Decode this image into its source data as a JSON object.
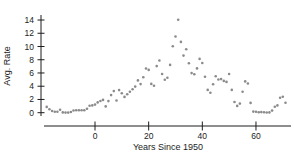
{
  "chart_data": {
    "type": "scatter",
    "title": "",
    "xlabel": "Years Since 1950",
    "ylabel": "Avg. Rate",
    "x_ticks": [
      0,
      20,
      40,
      60
    ],
    "y_ticks": [
      0,
      2,
      4,
      6,
      8,
      10,
      12,
      14
    ],
    "xlim": [
      -20,
      73
    ],
    "ylim": [
      0,
      14
    ],
    "grid": false,
    "legend": "none",
    "point_color": "#8b8b8b",
    "axis_color": "#1c1c1c",
    "points": [
      [
        -18,
        0.88
      ],
      [
        -17,
        0.52
      ],
      [
        -16,
        0.26
      ],
      [
        -15,
        0.14
      ],
      [
        -14,
        0.14
      ],
      [
        -13,
        0.45
      ],
      [
        -12,
        0.05
      ],
      [
        -11,
        0.02
      ],
      [
        -10,
        0.01
      ],
      [
        -9,
        0.1
      ],
      [
        -8,
        0.33
      ],
      [
        -7,
        0.37
      ],
      [
        -6,
        0.38
      ],
      [
        -5,
        0.38
      ],
      [
        -4,
        0.38
      ],
      [
        -3,
        0.6
      ],
      [
        -2,
        1.05
      ],
      [
        -1,
        1.1
      ],
      [
        0,
        1.22
      ],
      [
        1,
        1.55
      ],
      [
        2,
        1.77
      ],
      [
        3,
        1.94
      ],
      [
        4,
        0.95
      ],
      [
        5,
        1.75
      ],
      [
        6,
        2.66
      ],
      [
        7,
        3.27
      ],
      [
        8,
        1.84
      ],
      [
        9,
        3.41
      ],
      [
        10,
        2.93
      ],
      [
        11,
        2.38
      ],
      [
        12,
        2.78
      ],
      [
        13,
        3.16
      ],
      [
        14,
        3.55
      ],
      [
        15,
        3.95
      ],
      [
        16,
        4.88
      ],
      [
        17,
        4.32
      ],
      [
        18,
        5.34
      ],
      [
        19,
        6.68
      ],
      [
        20,
        6.46
      ],
      [
        21,
        4.35
      ],
      [
        22,
        4.07
      ],
      [
        23,
        7.04
      ],
      [
        24,
        7.89
      ],
      [
        25,
        5.84
      ],
      [
        26,
        4.99
      ],
      [
        27,
        5.27
      ],
      [
        28,
        7.22
      ],
      [
        29,
        10.04
      ],
      [
        30,
        11.51
      ],
      [
        31,
        14.03
      ],
      [
        32,
        10.69
      ],
      [
        33,
        8.63
      ],
      [
        34,
        9.58
      ],
      [
        35,
        7.48
      ],
      [
        36,
        5.98
      ],
      [
        37,
        5.82
      ],
      [
        38,
        6.69
      ],
      [
        39,
        8.12
      ],
      [
        40,
        7.51
      ],
      [
        41,
        5.42
      ],
      [
        42,
        3.45
      ],
      [
        43,
        3.02
      ],
      [
        44,
        4.29
      ],
      [
        45,
        5.51
      ],
      [
        46,
        5.02
      ],
      [
        47,
        5.07
      ],
      [
        48,
        4.81
      ],
      [
        49,
        4.66
      ],
      [
        50,
        5.85
      ],
      [
        51,
        3.45
      ],
      [
        52,
        1.62
      ],
      [
        53,
        1.02
      ],
      [
        54,
        1.38
      ],
      [
        55,
        3.16
      ],
      [
        56,
        4.73
      ],
      [
        57,
        4.41
      ],
      [
        58,
        1.48
      ],
      [
        59,
        0.16
      ],
      [
        60,
        0.14
      ],
      [
        61,
        0.06
      ],
      [
        62,
        0.09
      ],
      [
        63,
        0.06
      ],
      [
        64,
        0.03
      ],
      [
        65,
        0.05
      ],
      [
        66,
        0.32
      ],
      [
        67,
        0.9
      ],
      [
        68,
        1.1
      ],
      [
        69,
        2.25
      ],
      [
        70,
        2.4
      ],
      [
        71,
        1.5
      ]
    ]
  }
}
